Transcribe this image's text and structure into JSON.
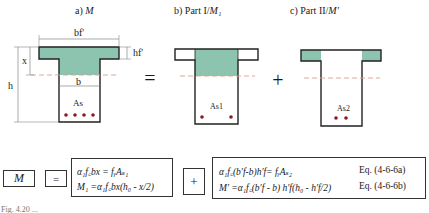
{
  "figure": {
    "panels": [
      {
        "id": "a",
        "title": "a) M",
        "label_prefix": "a) ",
        "label_var": "M",
        "rebar_label": "As",
        "bar_count": 4
      },
      {
        "id": "b",
        "title": "b) Part I/M1",
        "label_prefix": "b) Part I/",
        "label_var": "M₁",
        "rebar_label": "As1",
        "bar_count": 2
      },
      {
        "id": "c",
        "title": "c) Part II/M'",
        "label_prefix": "c) Part II/",
        "label_var": "M′",
        "rebar_label": "As2",
        "bar_count": 2
      }
    ],
    "dimensions": {
      "flange_width": "bf'",
      "flange_thickness": "hf'",
      "web_width": "b",
      "depth_compression": "x",
      "total_height": "h"
    },
    "operators": {
      "equals": "=",
      "plus": "+"
    },
    "colors": {
      "compression_fill": "#8cc4b0",
      "outline": "#222222",
      "neutral_axis": "#d9a08a",
      "rebar": "#8b1a1a",
      "dim_line": "#888888"
    }
  },
  "equations": {
    "lhs": "M",
    "equals": "=",
    "plus": "+",
    "part1": {
      "line1": "α₁f꜀bx = fᵧAₛ₁",
      "line2": "M₁ =α₁f꜀bx(h₀ - x/2)"
    },
    "part2": {
      "line1": "α₁f꜀(b′f-b)h′f= fᵧAₛ₂",
      "line1_tag": "Eq. (4-6-6a)",
      "line2": "M′ =α₁f꜀(b′f - b) h′f(h₀ - h′f/2)",
      "line2_tag": "Eq. (4-6-6b)"
    }
  },
  "caption": "Fig. 4.20  ..."
}
